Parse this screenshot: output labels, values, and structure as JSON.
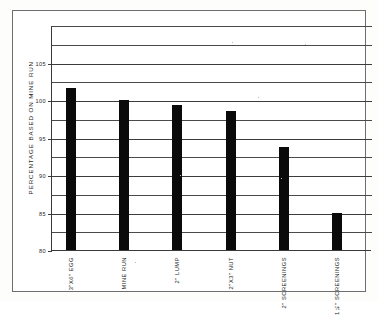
{
  "chart_data": {
    "type": "bar",
    "title": "",
    "subtitle": "",
    "xlabel": "",
    "ylabel": "PERCENTAGE BASED ON MINE RUN",
    "categories": [
      "3\"X6\" EGG",
      "MINE RUN",
      "2\" LUMP",
      "2\"X3\" NUT",
      "2\" SCREENINGS",
      "1¼\" SCREENINGS"
    ],
    "values": [
      101.6,
      100.0,
      99.3,
      98.5,
      93.7,
      85.0
    ],
    "ylim": [
      80,
      110
    ],
    "ytick_labels": [
      "80",
      "85",
      "90",
      "95",
      "100",
      "105"
    ],
    "ytick_values": [
      80,
      85,
      90,
      95,
      100,
      105
    ],
    "gridline_values": [
      80,
      82.5,
      85,
      87.5,
      90,
      92.5,
      95,
      97.5,
      100,
      102.5,
      105,
      107.5,
      110
    ],
    "grid": true,
    "legend": "none",
    "bar_color": "#0a0a0a",
    "axis_color": "#3a3a3a",
    "background_color": "#ffffff"
  },
  "labels": {
    "y_axis_title": "PERCENTAGE BASED ON MINE RUN",
    "ytick_0": "80",
    "ytick_1": "85",
    "ytick_2": "90",
    "ytick_3": "95",
    "ytick_4": "100",
    "ytick_5": "105",
    "xtick_0": "3\"X6\" EGG",
    "xtick_1": "MINE RUN",
    "xtick_2": "2\" LUMP",
    "xtick_3": "2\"X3\" NUT",
    "xtick_4": "2\" SCREENINGS",
    "xtick_5": "1¼\" SCREENINGS"
  }
}
